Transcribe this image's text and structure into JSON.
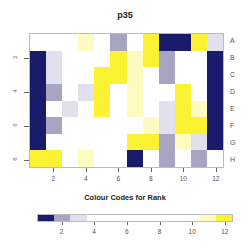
{
  "chart_data": {
    "type": "heatmap",
    "title": "p35",
    "xlabel": "",
    "ylabel": "",
    "columns": [
      1,
      2,
      3,
      4,
      5,
      6,
      7,
      8,
      9,
      10,
      11,
      12
    ],
    "rows": [
      "A",
      "B",
      "C",
      "D",
      "E",
      "F",
      "G",
      "H"
    ],
    "x_ticks": [
      2,
      4,
      6,
      8,
      10,
      12
    ],
    "y_ticks": [
      2,
      4,
      6,
      8
    ],
    "legend_title": "Colour Codes for Rank",
    "legend_ticks": [
      2,
      4,
      6,
      8,
      10,
      12
    ],
    "legend_range": [
      0.5,
      12.5
    ],
    "color_scale": [
      {
        "rank": 1,
        "color": "#1b1b6b"
      },
      {
        "rank": 2,
        "color": "#a7a5c2"
      },
      {
        "rank": 3,
        "color": "#e1e1ee"
      },
      {
        "rank": "4-10",
        "color": "#ffffff"
      },
      {
        "rank": 11,
        "color": "#fdfbc0"
      },
      {
        "rank": 12,
        "color": "#fbf234"
      }
    ],
    "cell_codes_legend": {
      "N": 1,
      "G": 2,
      "L": 3,
      "W": "4-10",
      "Y1": 11,
      "Y": 12
    },
    "values": [
      [
        "W",
        "W",
        "W",
        "Y1",
        "W",
        "G",
        "W",
        "Y",
        "N",
        "N",
        "Y",
        "L"
      ],
      [
        "N",
        "L",
        "W",
        "W",
        "W",
        "Y",
        "Y1",
        "Y",
        "G",
        "W",
        "W",
        "N"
      ],
      [
        "N",
        "L",
        "W",
        "W",
        "Y",
        "Y",
        "Y1",
        "W",
        "G",
        "W",
        "W",
        "N"
      ],
      [
        "N",
        "G",
        "W",
        "L",
        "Y",
        "W",
        "Y1",
        "W",
        "W",
        "Y",
        "W",
        "N"
      ],
      [
        "N",
        "W",
        "L",
        "W",
        "Y",
        "W",
        "Y1",
        "W",
        "L",
        "Y",
        "Y1",
        "N"
      ],
      [
        "N",
        "G",
        "W",
        "W",
        "W",
        "W",
        "W",
        "Y1",
        "L",
        "Y",
        "Y",
        "N"
      ],
      [
        "N",
        "W",
        "W",
        "W",
        "W",
        "W",
        "Y",
        "Y",
        "G",
        "Y1",
        "L",
        "N"
      ],
      [
        "Y",
        "Y",
        "W",
        "Y1",
        "W",
        "W",
        "N",
        "W",
        "G",
        "W",
        "G",
        "W"
      ]
    ]
  },
  "palette": {
    "N": "#1b1b6b",
    "G": "#a7a5c2",
    "L": "#e1e1ee",
    "W": "#ffffff",
    "Y1": "#fdfbc0",
    "Y": "#fbf234"
  },
  "legend_segments": [
    "N",
    "G",
    "L",
    "W",
    "W",
    "W",
    "W",
    "W",
    "W",
    "W",
    "Y1",
    "Y"
  ]
}
